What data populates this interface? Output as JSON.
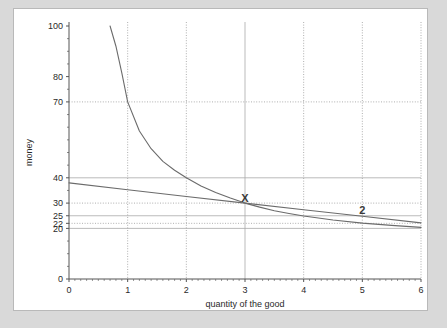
{
  "chart_data": {
    "type": "line",
    "title": "",
    "xlabel": "quantity of the good",
    "ylabel": "money",
    "xlim": [
      0,
      6
    ],
    "ylim": [
      0,
      100
    ],
    "xticks": [
      "0",
      "1",
      "2",
      "3",
      "4",
      "5",
      "6"
    ],
    "yticks": [
      "0",
      "20",
      "22",
      "25",
      "30",
      "40",
      "70",
      "80",
      "100"
    ],
    "grid": true,
    "grid_x_values": [
      1,
      2,
      3,
      4,
      5,
      6
    ],
    "grid_y_values": [
      20,
      22,
      25,
      30,
      40,
      70
    ],
    "legend": "none",
    "series": [
      {
        "name": "indifference-curve",
        "color": "#6b6b6b",
        "x": [
          0.7,
          0.8,
          0.9,
          1.0,
          1.2,
          1.4,
          1.6,
          1.8,
          2.0,
          2.25,
          2.5,
          2.75,
          3.0,
          3.25,
          3.5,
          3.75,
          4.0,
          4.5,
          5.0,
          5.5,
          6.0
        ],
        "y": [
          100.0,
          92.0,
          81.5,
          70.0,
          58.5,
          51.5,
          46.5,
          43.0,
          40.0,
          36.8,
          34.2,
          32.0,
          30.0,
          28.4,
          27.0,
          25.9,
          24.9,
          23.3,
          22.1,
          21.2,
          20.4
        ]
      },
      {
        "name": "budget-line",
        "color": "#6b6b6b",
        "x": [
          0.0,
          1.0,
          2.0,
          3.0,
          4.0,
          5.0,
          6.0
        ],
        "y": [
          38.0,
          35.3,
          32.6,
          30.0,
          27.4,
          24.8,
          22.2
        ]
      }
    ],
    "annotations": [
      {
        "label": "X",
        "x": 3.0,
        "y": 30.0,
        "name": "point-x-label"
      },
      {
        "label": "2",
        "x": 5.0,
        "y": 25.0,
        "name": "curve-2-label"
      }
    ]
  },
  "axis": {
    "y_title": "money",
    "x_title": "quantity of the good"
  },
  "colors": {
    "page_background": "#d9d9d9",
    "panel_background": "#ffffff",
    "panel_border": "#b9b9b9",
    "axis": "#555555",
    "grid_solid": "#aaaaaa",
    "grid_dotted": "#9a9a9a",
    "curve": "#6b6b6b",
    "text": "#2a2a2a"
  }
}
